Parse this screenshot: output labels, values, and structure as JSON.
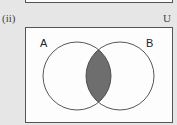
{
  "part_label": "(ii)",
  "universal_set_label": "U",
  "sets": [
    {
      "label": "A",
      "cx": 77,
      "cy": 76,
      "r": 34
    },
    {
      "label": "B",
      "cx": 120,
      "cy": 76,
      "r": 34
    }
  ],
  "shaded_region": "A ∩ B",
  "colors": {
    "background": "#e6e6e6",
    "box": "#fdfdfd",
    "outline": "#555555",
    "shade": "#6e6e6e"
  }
}
